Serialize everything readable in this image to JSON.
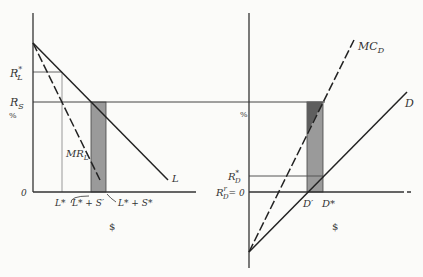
{
  "diagram": {
    "type": "economics-bank-loan-deposit-model",
    "colors": {
      "background": "#fbfbf9",
      "ink": "#333333",
      "guide": "#999999",
      "bar_light": "#9a9a9a",
      "bar_dark": "#5e5e5e"
    },
    "left_panel": {
      "y_axis_label": "%",
      "x_axis_label": "$",
      "origin_label": "0",
      "rate_labels": {
        "r_l_star": "R",
        "r_l_star_sup": "*",
        "r_l_star_sub": "L",
        "r_s": "R",
        "r_s_sub": "S"
      },
      "curve_labels": {
        "loan_demand": "L",
        "marginal_revenue": "MR",
        "marginal_revenue_sub": "L"
      },
      "x_tick_labels": {
        "l_star": "L*",
        "l_star_plus_s_prime": "L* + S′",
        "l_star_plus_s_star": "L* + S*"
      }
    },
    "right_panel": {
      "y_axis_label": "%",
      "x_axis_label": "$",
      "rate_labels": {
        "r_d_star": "R",
        "r_d_star_sup": "*",
        "r_d_star_sub": "D",
        "r_d_prime": "R",
        "r_d_prime_sup": "r",
        "r_d_prime_sub": "D",
        "r_d_prime_eq": "= 0"
      },
      "curve_labels": {
        "marginal_cost": "MC",
        "marginal_cost_sub": "D",
        "deposit_supply": "D"
      },
      "x_tick_labels": {
        "d_prime": "D′",
        "d_star": "D*"
      }
    }
  }
}
